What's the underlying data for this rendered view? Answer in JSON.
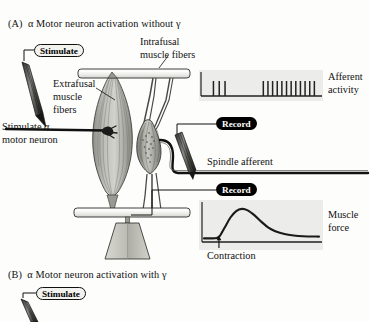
{
  "figure": {
    "panel_a_title": "(A)  α Motor neuron activation without γ",
    "panel_b_title": "(B)  α Motor neuron activation with γ"
  },
  "labels": {
    "stimulate_pill_a": "Stimulate",
    "stimulate_pill_b": "Stimulate",
    "record_pill_top": "Record",
    "record_pill_bottom": "Record",
    "extrafusal_line1": "Extrafusal",
    "extrafusal_line2": "muscle",
    "extrafusal_line3": "fibers",
    "intrafusal_line1": "Intrafusal",
    "intrafusal_line2": "muscle fibers",
    "stimulate_alpha_line1": "Stimulate α",
    "stimulate_alpha_line2": "motor neuron",
    "spindle_afferent": "Spindle afferent",
    "afferent_activity_line1": "Afferent",
    "afferent_activity_line2": "activity",
    "muscle_force_line1": "Muscle",
    "muscle_force_line2": "force",
    "contraction": "Contraction"
  },
  "colors": {
    "ink": "#111111",
    "trace_bg": "#ececeb",
    "muscle_fill": "#b9b9b5",
    "bar_fill": "#ededea",
    "weight_fill": "#c3c3bd",
    "pill_stim_bg": "#f2f2ef",
    "pill_rec_bg": "#000000"
  },
  "chart_data": [
    {
      "type": "line",
      "name": "afferent-activity-raster",
      "title": "Afferent activity",
      "xlabel": "",
      "ylabel": "",
      "description": "Spike raster: sparse baseline firing followed by a high-frequency burst",
      "baseline_spike_times": [
        0.09,
        0.14,
        0.19
      ],
      "burst_spike_times": [
        0.52,
        0.56,
        0.6,
        0.64,
        0.68,
        0.72,
        0.76,
        0.8,
        0.84,
        0.88,
        0.92,
        0.96
      ],
      "baseline_spike_count": 3,
      "burst_spike_count": 12,
      "spike_height": 0.55,
      "grid": false,
      "legend": "none"
    },
    {
      "type": "line",
      "name": "muscle-force-trace",
      "title": "Muscle force",
      "xlabel": "",
      "ylabel": "",
      "annotation": "Contraction",
      "annotation_x": 0.13,
      "x": [
        0.0,
        0.06,
        0.11,
        0.14,
        0.18,
        0.23,
        0.28,
        0.33,
        0.38,
        0.44,
        0.5,
        0.56,
        0.62,
        0.7,
        0.78,
        0.86,
        1.0
      ],
      "values": [
        0.1,
        0.1,
        0.11,
        0.18,
        0.4,
        0.68,
        0.86,
        0.92,
        0.88,
        0.74,
        0.56,
        0.4,
        0.3,
        0.22,
        0.18,
        0.16,
        0.15
      ],
      "ylim": [
        0,
        1
      ],
      "xlim": [
        0,
        1
      ],
      "grid": false,
      "legend": "none"
    }
  ]
}
